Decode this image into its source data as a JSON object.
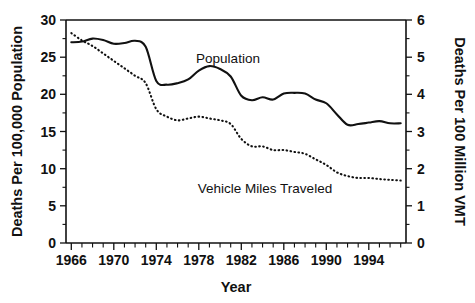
{
  "chart_data": {
    "type": "line",
    "title": "",
    "xlabel": "Year",
    "ylabel": "Deaths Per 100,000 Population",
    "y2label": "Deaths Per 100 Million VMT",
    "xlim": [
      1965.5,
      1997.5
    ],
    "ylim": [
      0,
      30
    ],
    "y2lim": [
      0,
      6
    ],
    "grid": false,
    "legend": "inline-annotations",
    "x_tick_labels": [
      "1966",
      "1970",
      "1974",
      "1978",
      "1982",
      "1986",
      "1990",
      "1994"
    ],
    "x_tick_values": [
      1966,
      1970,
      1974,
      1978,
      1982,
      1986,
      1990,
      1994
    ],
    "x_minor_tick_step": 1,
    "y_tick_labels": [
      "0",
      "5",
      "10",
      "15",
      "20",
      "25",
      "30"
    ],
    "y_tick_values": [
      0,
      5,
      10,
      15,
      20,
      25,
      30
    ],
    "y2_tick_labels": [
      "0",
      "1",
      "2",
      "3",
      "4",
      "5",
      "6"
    ],
    "y2_tick_values": [
      0,
      1,
      2,
      3,
      4,
      5,
      6
    ],
    "x": [
      1966,
      1967,
      1968,
      1969,
      1970,
      1971,
      1972,
      1973,
      1974,
      1975,
      1976,
      1977,
      1978,
      1979,
      1980,
      1981,
      1982,
      1983,
      1984,
      1985,
      1986,
      1987,
      1988,
      1989,
      1990,
      1991,
      1992,
      1993,
      1994,
      1995,
      1996,
      1997
    ],
    "series": [
      {
        "name": "Population",
        "axis": "left",
        "style": "solid",
        "label_text": "Population",
        "units": "deaths per 100,000 population",
        "values": [
          27.0,
          27.1,
          27.5,
          27.3,
          26.8,
          26.9,
          27.2,
          26.4,
          21.8,
          21.3,
          21.5,
          22.0,
          23.2,
          23.8,
          23.4,
          22.4,
          19.8,
          19.2,
          19.6,
          19.3,
          20.1,
          20.2,
          20.1,
          19.3,
          18.8,
          17.3,
          15.9,
          16.0,
          16.2,
          16.4,
          16.1,
          16.1
        ]
      },
      {
        "name": "Vehicle Miles Traveled",
        "axis": "right",
        "style": "dotted",
        "label_text": "Vehicle Miles Traveled",
        "units": "deaths per 100 million VMT",
        "values": [
          5.65,
          5.45,
          5.3,
          5.1,
          4.9,
          4.7,
          4.5,
          4.3,
          3.6,
          3.4,
          3.3,
          3.35,
          3.4,
          3.35,
          3.3,
          3.2,
          2.8,
          2.6,
          2.6,
          2.5,
          2.5,
          2.45,
          2.4,
          2.25,
          2.1,
          1.9,
          1.8,
          1.75,
          1.75,
          1.72,
          1.7,
          1.68
        ]
      }
    ],
    "annotations": [
      {
        "text": "Population",
        "x": 1978.0,
        "y_px": 58
      },
      {
        "text": "Vehicle Miles Traveled",
        "x": 1983.5,
        "y_px": 189
      }
    ],
    "colors": {
      "ink": "#111111",
      "background": "#ffffff"
    }
  }
}
